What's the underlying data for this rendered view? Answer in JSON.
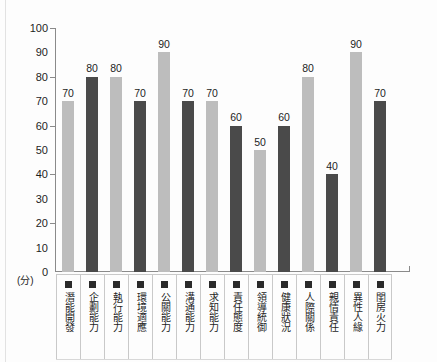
{
  "chart_data": {
    "type": "bar",
    "title": "",
    "xlabel": "",
    "ylabel": "",
    "yunit": "(分)",
    "ylim": [
      0,
      100
    ],
    "ytick_labels": [
      "100",
      "90",
      "80",
      "70",
      "60",
      "50",
      "40",
      "30",
      "20",
      "10",
      "0"
    ],
    "ytick_values": [
      100,
      90,
      80,
      70,
      60,
      50,
      40,
      30,
      20,
      10,
      0
    ],
    "major_ticks": [
      100,
      80,
      60,
      40,
      20,
      0
    ],
    "grid": false,
    "legend": "none",
    "categories": [
      "潛能開發",
      "企劃能力",
      "執行能力",
      "環境適應",
      "公關能力",
      "溝通能力",
      "求知能力",
      "責任態度",
      "領導統御",
      "健康狀況",
      "人際關係",
      "親情責任",
      "異性人緣",
      "閨房火力"
    ],
    "values": [
      70,
      80,
      80,
      70,
      90,
      70,
      70,
      60,
      50,
      60,
      80,
      40,
      90,
      70
    ],
    "bar_shades": [
      "light",
      "dark",
      "light",
      "dark",
      "light",
      "dark",
      "light",
      "dark",
      "light",
      "dark",
      "light",
      "dark",
      "light",
      "dark"
    ],
    "colors": {
      "light_bar": "#bdbdbd",
      "dark_bar": "#4a4a4a",
      "axis": "#8a8a8a",
      "text": "#1d1d1d",
      "swatch": "#2a2a2a",
      "background": "#fdfdfd"
    },
    "swatch_icon": "filled-square"
  }
}
